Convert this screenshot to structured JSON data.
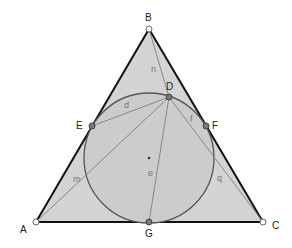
{
  "diagram": {
    "points": {
      "A": {
        "label": "A",
        "x": 36,
        "y": 222
      },
      "B": {
        "label": "B",
        "x": 149,
        "y": 29
      },
      "C": {
        "label": "C",
        "x": 263,
        "y": 222
      },
      "D": {
        "label": "D",
        "x": 169,
        "y": 97
      },
      "E": {
        "label": "E",
        "x": 92,
        "y": 126
      },
      "F": {
        "label": "F",
        "x": 206,
        "y": 126
      },
      "G": {
        "label": "G",
        "x": 149,
        "y": 222
      }
    },
    "incircle": {
      "cx": 149,
      "cy": 158,
      "r": 65,
      "center_label": "e"
    },
    "segments": {
      "n": "n",
      "d": "d",
      "f": "f",
      "m": "m",
      "q": "q"
    },
    "colors": {
      "fill": "#d4d4d4",
      "triangle_stroke": "#111111",
      "circle_stroke": "#555555",
      "line_stroke": "#888888"
    }
  }
}
